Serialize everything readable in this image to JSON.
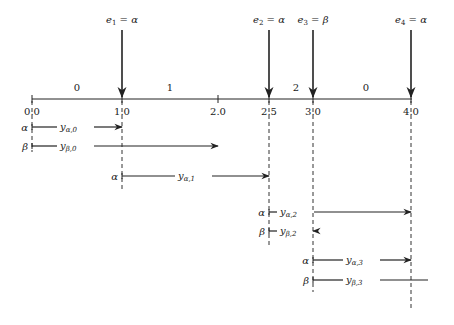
{
  "diagram": {
    "axis": {
      "y": 99,
      "x_start": 32,
      "x_end": 412,
      "ticks": [
        {
          "value": "0.0",
          "x": 32
        },
        {
          "value": "1.0",
          "x": 122
        },
        {
          "value": "2.0",
          "x": 218
        },
        {
          "value": "2.5",
          "x": 269
        },
        {
          "value": "3.0",
          "x": 313
        },
        {
          "value": "4.0",
          "x": 411
        }
      ],
      "interval_labels": [
        {
          "text": "0",
          "x": 77
        },
        {
          "text": "1",
          "x": 170
        },
        {
          "text": "2",
          "x": 296
        },
        {
          "text": "0",
          "x": 366
        }
      ]
    },
    "events": [
      {
        "name": "e",
        "index": "1",
        "symbol": "α",
        "x": 122,
        "label": "e1 = α"
      },
      {
        "name": "e",
        "index": "2",
        "symbol": "α",
        "x": 269,
        "label": "e2 = α"
      },
      {
        "name": "e",
        "index": "3",
        "symbol": "β",
        "x": 313,
        "label": "e3 = β"
      },
      {
        "name": "e",
        "index": "4",
        "symbol": "α",
        "x": 411,
        "label": "e4 = α"
      }
    ],
    "dashed_lines": [
      {
        "x": 32,
        "y_end": 152
      },
      {
        "x": 122,
        "y_end": 190
      },
      {
        "x": 269,
        "y_end": 245
      },
      {
        "x": 313,
        "y_end": 292
      },
      {
        "x": 411,
        "y_end": 310
      }
    ],
    "segments": [
      {
        "symbol": "α",
        "var": "y",
        "sub": "α,0",
        "x1": 32,
        "x2": 122,
        "y": 127,
        "arrow": true,
        "text_x": 60
      },
      {
        "symbol": "β",
        "var": "y",
        "sub": "β,0",
        "x1": 32,
        "x2": 218,
        "y": 146,
        "arrow": true,
        "text_x": 60
      },
      {
        "symbol": "α",
        "var": "y",
        "sub": "α,1",
        "x1": 122,
        "x2": 269,
        "y": 176,
        "arrow": true,
        "text_x": 178
      },
      {
        "symbol": "α",
        "var": "y",
        "sub": "α,2",
        "x1": 269,
        "x2": 411,
        "y": 212,
        "arrow": true,
        "text_x": 280
      },
      {
        "symbol": "β",
        "var": "y",
        "sub": "β,2",
        "x1": 269,
        "x2": 313,
        "y": 231,
        "arrow": true,
        "text_x": 280
      },
      {
        "symbol": "α",
        "var": "y",
        "sub": "α,3",
        "x1": 313,
        "x2": 411,
        "y": 260,
        "arrow": true,
        "text_x": 346
      },
      {
        "symbol": "β",
        "var": "y",
        "sub": "β,3",
        "x1": 313,
        "x2": 428,
        "y": 280,
        "arrow": false,
        "text_x": 346
      }
    ]
  },
  "colors": {
    "line": "#222222",
    "dash": "#333333",
    "background": "#ffffff"
  }
}
